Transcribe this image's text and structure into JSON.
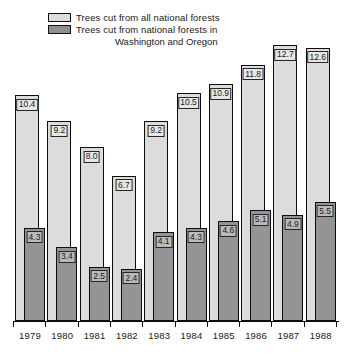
{
  "legend": {
    "series1_label": "Trees cut from all national forests",
    "series2_label": "Trees cut from national forests in",
    "series2_label_line2": "Washington and Oregon",
    "swatch1_color": "#dcdcdc",
    "swatch2_color": "#8f8f8f"
  },
  "chart_data": {
    "type": "bar",
    "title": "",
    "subtitle": "",
    "xlabel": "",
    "ylabel": "",
    "grid": false,
    "legend_position": "top-left",
    "ylim": [
      0,
      13.5
    ],
    "categories": [
      "1979",
      "1980",
      "1981",
      "1982",
      "1983",
      "1984",
      "1985",
      "1986",
      "1987",
      "1988"
    ],
    "series": [
      {
        "name": "Trees cut from all national forests",
        "color": "#dcdcdc",
        "values": [
          10.4,
          9.2,
          8.0,
          6.7,
          9.2,
          10.5,
          10.9,
          11.8,
          12.7,
          12.6
        ],
        "labels": [
          "10.4",
          "9.2",
          "8.0",
          "6.7",
          "9.2",
          "10.5",
          "10.9",
          "11.8",
          "12.7",
          "12.6"
        ]
      },
      {
        "name": "Trees cut from national forests in Washington and Oregon",
        "color": "#949494",
        "values": [
          4.3,
          3.4,
          2.5,
          2.4,
          4.1,
          4.3,
          4.6,
          5.1,
          4.9,
          5.5
        ],
        "labels": [
          "4.3",
          "3.4",
          "2.5",
          "2.4",
          "4.1",
          "4.3",
          "4.6",
          "5.1",
          "4.9",
          "5.5"
        ]
      }
    ]
  }
}
